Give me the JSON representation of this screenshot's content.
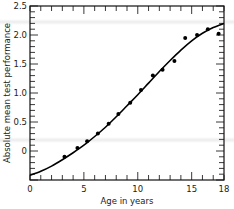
{
  "chart_data": {
    "type": "scatter",
    "title": "",
    "xlabel": "Age in years",
    "ylabel": "Absolute mean test performance",
    "xlim": [
      0,
      18
    ],
    "ylim": [
      -0.5,
      2.5
    ],
    "x_ticks": [
      0,
      5,
      10,
      15,
      18
    ],
    "x_tick_labels": [
      "0",
      "5",
      "10",
      "15",
      "18"
    ],
    "y_ticks": [
      0,
      0.5,
      1.0,
      1.5,
      2.0,
      2.5
    ],
    "y_tick_labels": [
      "0",
      "0.5",
      "1.0",
      "1.5",
      "2.0",
      "2.5"
    ],
    "grid": false,
    "legend": null,
    "series": [
      {
        "name": "Observed means",
        "kind": "scatter",
        "x": [
          3.2,
          4.4,
          5.3,
          6.3,
          7.3,
          8.2,
          9.3,
          10.3,
          11.4,
          12.3,
          13.4,
          14.4,
          15.5,
          16.5,
          17.5
        ],
        "y": [
          -0.1,
          0.05,
          0.17,
          0.3,
          0.47,
          0.64,
          0.83,
          1.05,
          1.3,
          1.4,
          1.55,
          1.95,
          2.0,
          2.1,
          2.02
        ]
      },
      {
        "name": "Fitted curve",
        "kind": "line",
        "x": [
          0,
          1,
          2,
          3,
          4,
          5,
          6,
          7,
          8,
          9,
          10,
          11,
          12,
          13,
          14,
          15,
          16,
          17,
          18
        ],
        "y": [
          -0.42,
          -0.35,
          -0.26,
          -0.15,
          -0.03,
          0.1,
          0.25,
          0.41,
          0.59,
          0.78,
          0.97,
          1.17,
          1.37,
          1.56,
          1.74,
          1.9,
          2.03,
          2.13,
          2.2
        ]
      }
    ]
  }
}
